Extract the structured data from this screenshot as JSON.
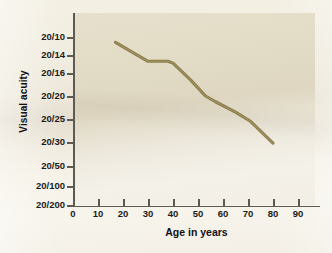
{
  "chart_data": {
    "type": "line",
    "title": "",
    "xlabel": "Age in years",
    "ylabel": "Visual acuity",
    "x_ticks": [
      0,
      10,
      20,
      30,
      40,
      50,
      60,
      70,
      80,
      90
    ],
    "x_tick_labels": [
      "0",
      "10",
      "20",
      "30",
      "40",
      "50",
      "60",
      "70",
      "80",
      "90"
    ],
    "y_tick_labels": [
      "20/10",
      "20/14",
      "20/16",
      "20/20",
      "20/25",
      "20/30",
      "20/50",
      "20/100",
      "20/200"
    ],
    "y_axis_note": "Visual acuity ordinal scale, best (20/10) at top to worst (20/200) at bottom",
    "xlim": [
      0,
      99
    ],
    "ylim_labels": [
      "20/10",
      "20/200"
    ],
    "grid": false,
    "legend": false,
    "series": [
      {
        "name": "Visual acuity vs age",
        "color": "#8a7c4a",
        "points": [
          {
            "age": 17,
            "acuity": "20/11",
            "acuity_index": 0.3
          },
          {
            "age": 30,
            "acuity": "20/14",
            "acuity_index": 1.35
          },
          {
            "age": 38,
            "acuity": "20/14",
            "acuity_index": 1.35
          },
          {
            "age": 40,
            "acuity": "20/14.5",
            "acuity_index": 1.45
          },
          {
            "age": 47,
            "acuity": "20/17",
            "acuity_index": 2.3
          },
          {
            "age": 53,
            "acuity": "20/20",
            "acuity_index": 3.0
          },
          {
            "age": 57,
            "acuity": "20/21",
            "acuity_index": 3.25
          },
          {
            "age": 65,
            "acuity": "20/23",
            "acuity_index": 3.7
          },
          {
            "age": 71,
            "acuity": "20/25",
            "acuity_index": 4.1
          },
          {
            "age": 80,
            "acuity": "20/30",
            "acuity_index": 5.05
          }
        ]
      }
    ]
  },
  "colors": {
    "line": "#8a7c4a",
    "axis": "#5d5a52",
    "panel_tint": "#e4ddc8",
    "page": "#f2eee2",
    "text": "#111111"
  }
}
